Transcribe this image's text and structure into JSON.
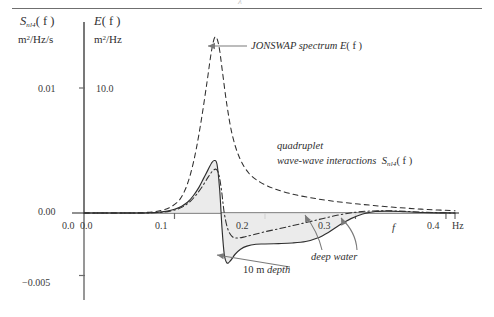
{
  "figure": {
    "background": "#ffffff",
    "ink": "#2f2f2f",
    "axis_color": "#6b6b6b",
    "fill_color": "#e8e8e8",
    "ghost_descender": "λ"
  },
  "axes": {
    "left": {
      "title_main": "S",
      "title_sub": "nl4",
      "title_arg": "( f )",
      "unit_num": "m",
      "unit_sup": "2",
      "unit_den": "/Hz/s",
      "ticks": [
        {
          "label": "0.01",
          "value": 0.01
        },
        {
          "label": "0.00",
          "value": 0.0
        },
        {
          "label": "−0.005",
          "value": -0.005
        }
      ],
      "range": [
        -0.006,
        0.0145
      ]
    },
    "right": {
      "title_main": "E",
      "title_arg": "( f )",
      "unit_num": "m",
      "unit_sup": "2",
      "unit_den": "/Hz",
      "ticks": [
        {
          "label": "10.0",
          "value": 10.0
        },
        {
          "label": "0.0",
          "value": 0.0
        }
      ],
      "range": [
        0,
        14.5
      ]
    },
    "x": {
      "symbol": "f",
      "unit": "Hz",
      "ticks": [
        {
          "label": "0.0",
          "value": 0.0
        },
        {
          "label": "0.1",
          "value": 0.1
        },
        {
          "label": "0.2",
          "value": 0.2
        },
        {
          "label": "0.3",
          "value": 0.3
        },
        {
          "label": "0.4",
          "value": 0.4
        }
      ],
      "range": [
        0.0,
        0.41
      ]
    }
  },
  "annotations": {
    "jonswap": {
      "text_main": "JONSWAP spectrum E",
      "text_arg": "( f )"
    },
    "quadruplet": {
      "line1": "quadruplet",
      "line2": "wave-wave interactions",
      "symbol_main": "S",
      "symbol_sub": "nl4",
      "symbol_arg": "( f )"
    },
    "depth": {
      "value": "10 m",
      "word": "depth"
    },
    "deepwater": {
      "line1": "deep",
      "line2": "water"
    }
  },
  "chart_data": {
    "type": "line",
    "title": "",
    "xlabel": "f (Hz)",
    "ylabel": "S_nl4 (f)  m^2/Hz/s   |   E(f)  m^2/Hz",
    "xlim": [
      0.0,
      0.41
    ],
    "ylim_left": [
      -0.006,
      0.0145
    ],
    "ylim_right": [
      0.0,
      14.5
    ],
    "grid": false,
    "legend": "inline annotations",
    "series": [
      {
        "name": "JONSWAP spectrum E(f)",
        "style": "dashed",
        "axis": "right",
        "x": [
          0.0,
          0.05,
          0.07,
          0.085,
          0.095,
          0.105,
          0.112,
          0.118,
          0.124,
          0.13,
          0.136,
          0.141,
          0.145,
          0.149,
          0.153,
          0.158,
          0.164,
          0.172,
          0.182,
          0.195,
          0.21,
          0.228,
          0.248,
          0.27,
          0.295,
          0.32,
          0.35,
          0.38,
          0.41
        ],
        "y": [
          0.0,
          0.0,
          0.05,
          0.2,
          0.45,
          1.0,
          1.9,
          3.2,
          5.1,
          7.6,
          10.5,
          13.0,
          14.1,
          13.4,
          11.3,
          8.6,
          6.2,
          4.4,
          3.2,
          2.45,
          1.95,
          1.55,
          1.25,
          1.0,
          0.78,
          0.6,
          0.42,
          0.28,
          0.18
        ]
      },
      {
        "name": "10 m depth",
        "style": "solid",
        "axis": "left",
        "x": [
          0.0,
          0.06,
          0.08,
          0.092,
          0.1,
          0.108,
          0.115,
          0.121,
          0.127,
          0.132,
          0.137,
          0.141,
          0.144,
          0.147,
          0.15,
          0.1525,
          0.155,
          0.158,
          0.162,
          0.167,
          0.173,
          0.18,
          0.19,
          0.2,
          0.215,
          0.23,
          0.245,
          0.258,
          0.27,
          0.282,
          0.295,
          0.308,
          0.322,
          0.338,
          0.355,
          0.375,
          0.395,
          0.41
        ],
        "y": [
          0.0,
          0.0,
          5e-05,
          0.00015,
          0.0003,
          0.00055,
          0.0009,
          0.0014,
          0.00205,
          0.00275,
          0.00345,
          0.004,
          0.0042,
          0.0039,
          0.0018,
          -0.0012,
          -0.0033,
          -0.004,
          -0.0038,
          -0.0033,
          -0.0029,
          -0.00265,
          -0.0025,
          -0.00248,
          -0.00245,
          -0.0024,
          -0.00228,
          -0.002,
          -0.00155,
          -0.00098,
          -0.00045,
          -8e-05,
          0.00012,
          0.00015,
          0.0001,
          4e-05,
          1e-05,
          0.0
        ]
      },
      {
        "name": "deep water",
        "style": "dash-dot",
        "axis": "left",
        "x": [
          0.0,
          0.06,
          0.085,
          0.098,
          0.108,
          0.117,
          0.124,
          0.131,
          0.137,
          0.142,
          0.146,
          0.149,
          0.152,
          0.155,
          0.159,
          0.164,
          0.17,
          0.178,
          0.188,
          0.2,
          0.214,
          0.228,
          0.242,
          0.256,
          0.27,
          0.284,
          0.298,
          0.312,
          0.328,
          0.345,
          0.365,
          0.385,
          0.41
        ],
        "y": [
          0.0,
          0.0,
          5e-05,
          0.0002,
          0.00045,
          0.0009,
          0.00145,
          0.00215,
          0.00285,
          0.00335,
          0.0035,
          0.0031,
          0.0018,
          0.0,
          -0.0013,
          -0.0019,
          -0.002,
          -0.0019,
          -0.00172,
          -0.0015,
          -0.00128,
          -0.00105,
          -0.00082,
          -0.00058,
          -0.00034,
          -0.00012,
          4e-05,
          0.00014,
          0.00018,
          0.00016,
          0.0001,
          4e-05,
          0.0
        ]
      }
    ],
    "shaded_region": {
      "description": "light gray fill between the 10 m depth curve and the zero line",
      "color": "#e8e8e8"
    }
  }
}
